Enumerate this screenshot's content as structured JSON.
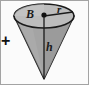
{
  "figure": {
    "kind": "geometry-diagram",
    "shape": "inverted-cone",
    "canvas": {
      "width": 89,
      "height": 85
    },
    "background_color": "#fbfbfb",
    "border_color": "#9a9a9a",
    "outline_color": "#1a1a1a",
    "labels": {
      "base_area": "B",
      "radius": "r",
      "height": "h"
    },
    "operator": "+",
    "colors": {
      "cone_body_fill": "#a8a8a8",
      "cone_body_shade": "#8f8f8f",
      "ellipse_top_fill": "#b9b9b9",
      "center_dot": "#111111",
      "line": "#1a1a1a"
    },
    "geometry": {
      "ellipse_center_x": 44,
      "ellipse_center_y": 16,
      "ellipse_rx": 30,
      "ellipse_ry": 12,
      "apex_x": 44,
      "apex_y": 79,
      "radius_line_end_x": 74,
      "height_line_top_y": 16
    }
  }
}
